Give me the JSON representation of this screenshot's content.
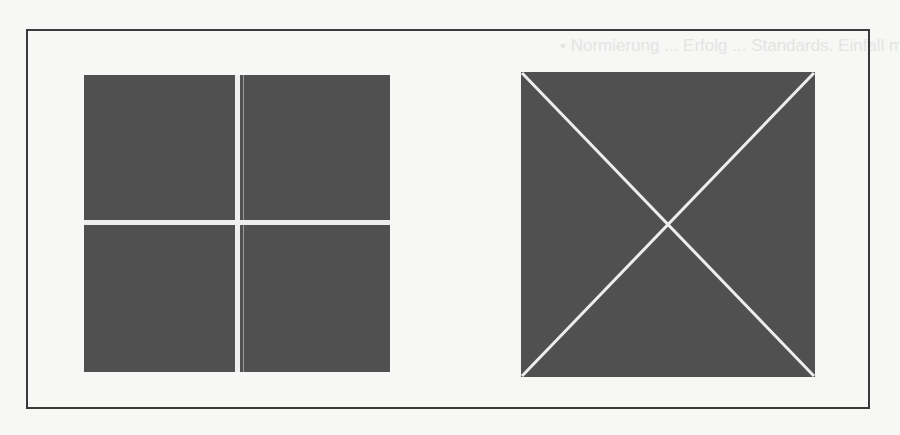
{
  "figure": {
    "type": "scanned-figure",
    "frame_color": "#3a3a3a",
    "panel_fill": "#505050",
    "line_color": "#eeeeee",
    "panels": [
      {
        "id": "left",
        "description": "square divided into four quadrants by a white cross",
        "divisions": "cross",
        "quadrants": 4
      },
      {
        "id": "right",
        "description": "square divided into four triangles by white diagonals",
        "divisions": "diagonals",
        "triangles": 4
      }
    ]
  },
  "showthrough_text": [
    "•   Normierung ... Erfolg ... Standards. Einfall ma-",
    "                                                  ... ation",
    "                                                  ... ngen",
    "                                                  ... od or",
    "                                                  ... en",
    "Iter ...                                          ... llie-",
    "... alte ...",
    "... Rezeptionsweisen ... für neue Sehgewohnheiten •",
    "... Konzept ... Grenzen ... Gegenüber ..."
  ]
}
